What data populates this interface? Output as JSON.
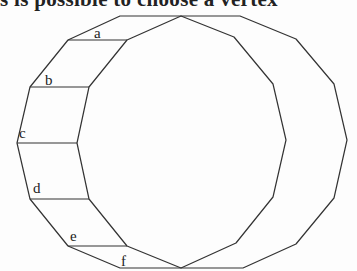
{
  "clipped_text": "s is possible to choose a vertex",
  "diagram": {
    "stroke_color": "#333333",
    "labels": [
      "a",
      "b",
      "c",
      "d",
      "e",
      "f"
    ]
  }
}
